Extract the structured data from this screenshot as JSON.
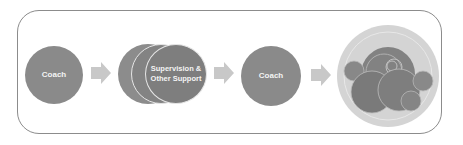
{
  "diagram": {
    "steps": [
      {
        "label": "Coach"
      },
      {
        "label_line1": "Supervision &",
        "label_line2": "Other Support"
      },
      {
        "label": "Coach"
      },
      {
        "label": ""
      }
    ],
    "colors": {
      "circle": "#8a8a8a",
      "circle_dark": "#7a7a7a",
      "arrow": "#c8c8c8",
      "outer_ring": "#d4d4d4",
      "border": "#8c8c8c"
    }
  }
}
